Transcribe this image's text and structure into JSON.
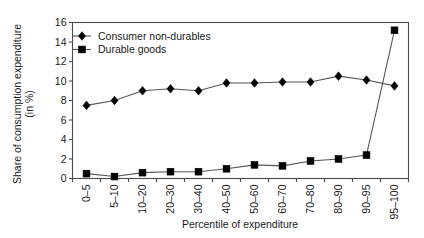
{
  "chart_data": {
    "type": "line",
    "title": "",
    "xlabel": "Percentile of expenditure",
    "ylabel": "Share of consumption expenditure (in %)",
    "ylabel_line1": "Share of consumption expenditure",
    "ylabel_line2": "(in %)",
    "categories": [
      "0–5",
      "5–10",
      "10–20",
      "20–30",
      "30–40",
      "40–50",
      "50–60",
      "60–70",
      "70–80",
      "80–90",
      "90–95",
      "95–100"
    ],
    "ylim": [
      0,
      16
    ],
    "yticks": [
      0,
      2,
      4,
      6,
      8,
      10,
      12,
      14,
      16
    ],
    "ytick_labels": [
      "0",
      "2",
      "4",
      "6",
      "8",
      "10",
      "12",
      "14",
      "16"
    ],
    "grid": false,
    "legend_position": "top-left",
    "series": [
      {
        "name": "Consumer non-durables",
        "marker": "diamond",
        "color": "#000000",
        "values": [
          7.5,
          8.0,
          9.0,
          9.2,
          9.0,
          9.8,
          9.8,
          9.9,
          9.9,
          10.5,
          10.1,
          9.5
        ]
      },
      {
        "name": "Durable goods",
        "marker": "square",
        "color": "#000000",
        "values": [
          0.5,
          0.2,
          0.6,
          0.7,
          0.7,
          1.0,
          1.4,
          1.3,
          1.8,
          2.0,
          2.4,
          15.2
        ]
      }
    ]
  },
  "legend": {
    "items": [
      {
        "label": "Consumer non-durables",
        "marker": "diamond"
      },
      {
        "label": "Durable goods",
        "marker": "square"
      }
    ]
  },
  "axes": {
    "x_title": "Percentile of expenditure",
    "y_title_line1": "Share of consumption expenditure",
    "y_title_line2": "(in %)"
  }
}
